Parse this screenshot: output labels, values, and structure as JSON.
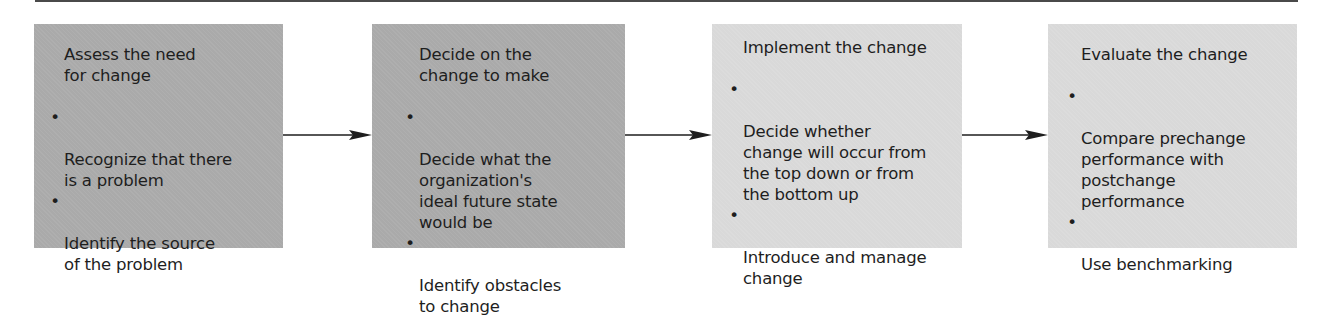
{
  "diagram": {
    "type": "process-flow",
    "colors": {
      "dark_box": "#aaaaaa",
      "light_box": "#d9d9d9",
      "text": "#1e1e1e",
      "arrow": "#1e1e1e",
      "rule": "#4a4a4a"
    },
    "steps": [
      {
        "title": "Assess the need\nfor change",
        "bullet_symbol": "•",
        "bullets": [
          "Recognize that there\nis a problem",
          "Identify the source\nof the problem"
        ]
      },
      {
        "title": "Decide on the\nchange to make",
        "bullet_symbol": "•",
        "bullets": [
          "Decide what the\norganization's\nideal future state\nwould be",
          "Identify obstacles\nto change"
        ]
      },
      {
        "title": "Implement the change",
        "bullet_symbol": "•",
        "bullets": [
          "Decide whether\nchange will occur from\nthe top down or from\nthe bottom up",
          "Introduce and manage\nchange"
        ]
      },
      {
        "title": "Evaluate the change",
        "bullet_symbol": "•",
        "bullets": [
          "Compare prechange\nperformance with\npostchange\nperformance",
          "Use benchmarking"
        ]
      }
    ],
    "arrows": [
      {
        "from": 0,
        "to": 1
      },
      {
        "from": 1,
        "to": 2
      },
      {
        "from": 2,
        "to": 3
      }
    ]
  }
}
